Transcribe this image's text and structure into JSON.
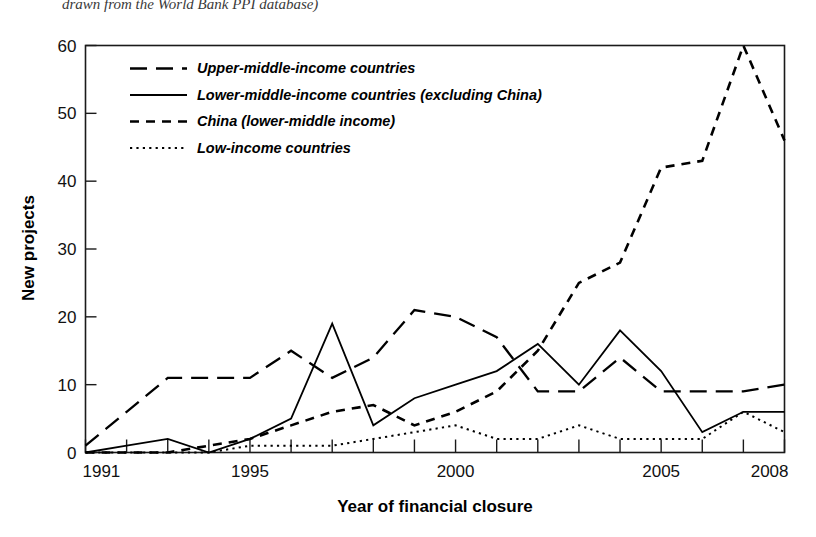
{
  "caption": {
    "text": "drawn from the World Bank PPI database)"
  },
  "chart_data": {
    "type": "line",
    "title": "",
    "xlabel": "Year of financial closure",
    "ylabel": "New projects",
    "xlim": [
      1991,
      2008
    ],
    "ylim": [
      0,
      60
    ],
    "ytick_labels": [
      "0",
      "10",
      "20",
      "30",
      "40",
      "50",
      "60"
    ],
    "yticks": [
      0,
      10,
      20,
      30,
      40,
      50,
      60
    ],
    "xtick_labels": [
      "1991",
      "1995",
      "2000",
      "2005",
      "2008"
    ],
    "xticks": [
      1991,
      1995,
      2000,
      2005,
      2008
    ],
    "grid": false,
    "legend_position": "upper-left-inside",
    "x": [
      1991,
      1992,
      1993,
      1994,
      1995,
      1996,
      1997,
      1998,
      1999,
      2000,
      2001,
      2002,
      2003,
      2004,
      2005,
      2006,
      2007,
      2008
    ],
    "series": [
      {
        "name": "Upper-middle-income countries",
        "style": "long-dash",
        "values": [
          1,
          6,
          11,
          11,
          11,
          15,
          11,
          14,
          21,
          20,
          17,
          9,
          9,
          14,
          9,
          9,
          9,
          10
        ]
      },
      {
        "name": "Lower-middle-income countries (excluding China)",
        "style": "solid",
        "values": [
          0,
          1,
          2,
          0,
          2,
          5,
          19,
          4,
          8,
          10,
          12,
          16,
          10,
          18,
          12,
          3,
          6,
          6
        ]
      },
      {
        "name": "China (lower-middle income)",
        "style": "short-dash",
        "values": [
          0,
          0,
          0,
          1,
          2,
          4,
          6,
          7,
          4,
          6,
          9,
          15,
          25,
          28,
          42,
          43,
          60,
          46
        ]
      },
      {
        "name": "Low-income countries",
        "style": "dotted",
        "values": [
          0,
          0,
          0,
          0,
          1,
          1,
          1,
          2,
          3,
          4,
          2,
          2,
          4,
          2,
          2,
          2,
          6,
          3
        ]
      }
    ]
  },
  "legend": {
    "items": [
      {
        "label": "Upper-middle-income countries"
      },
      {
        "label": "Lower-middle-income countries (excluding China)"
      },
      {
        "label": "China (lower-middle income)"
      },
      {
        "label": "Low-income countries"
      }
    ]
  }
}
